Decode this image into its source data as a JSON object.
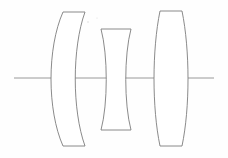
{
  "figure": {
    "kind": "optical-lens-cross-section",
    "title": "",
    "background_color": "#fefefe",
    "stroke_color": "#7d7d7d",
    "fill_color": "#ffffff",
    "axis_color": "#8f8f8f",
    "width": 228,
    "height": 158
  },
  "optical_axis": {
    "name": "optical-axis",
    "y": 78,
    "x_start": 14,
    "x_end": 214,
    "label": ""
  },
  "elements": [
    {
      "id": "lens-1",
      "type": "meniscus",
      "label": "",
      "top_y": 12,
      "bottom_y": 147,
      "axis_left_x": 52,
      "axis_right_x": 79,
      "top_left_x": 63,
      "top_right_x": 85,
      "bottom_left_x": 63,
      "bottom_right_x": 85,
      "path": "M 63 12 L 85 12 C 72 48 72 110 85 146 L 63 146 C 47 110 47 48 63 12 Z"
    },
    {
      "id": "lens-2",
      "type": "biconcave",
      "label": "",
      "top_y": 29,
      "bottom_y": 130,
      "axis_left_x": 105,
      "axis_right_x": 126,
      "top_left_x": 101,
      "top_right_x": 131,
      "bottom_left_x": 101,
      "bottom_right_x": 131,
      "path": "M 101 29 L 131 29 C 124 55 124 104 131 130 L 101 130 C 108 104 108 55 101 29 Z"
    },
    {
      "id": "lens-3",
      "type": "biconvex",
      "label": "",
      "top_y": 11,
      "bottom_y": 146,
      "axis_left_x": 152,
      "axis_right_x": 186,
      "top_left_x": 160,
      "top_right_x": 182,
      "bottom_left_x": 160,
      "bottom_right_x": 182,
      "path": "M 160 11 L 182 11 C 190 50 190 108 182 146 L 160 146 C 152 108 152 50 160 11 Z"
    }
  ],
  "specks": [
    {
      "id": "speck-1",
      "x": 88,
      "y": 22,
      "r": 0.8
    },
    {
      "id": "speck-2",
      "x": 97,
      "y": 18,
      "r": 0.6
    }
  ],
  "chart_data": {
    "type": "diagram",
    "title": "",
    "series": [
      {
        "name": "lens-1",
        "shape": "meniscus",
        "thickness_on_axis": 27,
        "height": 135
      },
      {
        "name": "lens-2",
        "shape": "biconcave",
        "thickness_on_axis": 21,
        "height": 101
      },
      {
        "name": "lens-3",
        "shape": "biconvex",
        "thickness_on_axis": 34,
        "height": 135
      }
    ]
  }
}
